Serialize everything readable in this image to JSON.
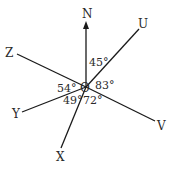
{
  "diagram": {
    "type": "angles-around-point",
    "center": {
      "label": "O"
    },
    "rays": [
      {
        "label": "N",
        "has_arrow": true
      },
      {
        "label": "U"
      },
      {
        "label": "V"
      },
      {
        "label": "X"
      },
      {
        "label": "Y"
      },
      {
        "label": "Z"
      }
    ],
    "angles": [
      {
        "between": "N-U",
        "value": "45°"
      },
      {
        "between": "U-V",
        "value": "83°"
      },
      {
        "between": "V-X",
        "value": "72°"
      },
      {
        "between": "X-Y",
        "value": "49°"
      },
      {
        "between": "Y-Z",
        "value": "54°"
      }
    ],
    "colors": {
      "line": "#1a1a1a",
      "text": "#2a2a2a",
      "background": "#ffffff"
    }
  }
}
